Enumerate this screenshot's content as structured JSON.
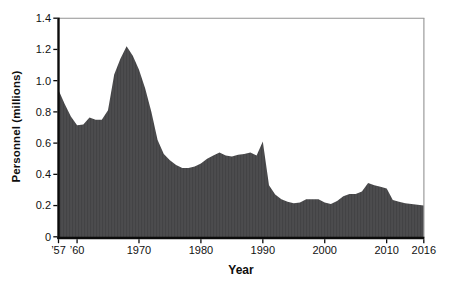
{
  "figure": {
    "background": "#ffffff"
  },
  "chart_data": {
    "type": "area",
    "title": "",
    "xlabel": "Year",
    "ylabel": "Personnel (millions)",
    "xlim": [
      1957,
      2016
    ],
    "ylim": [
      0,
      1.4
    ],
    "grid": false,
    "legend": "none",
    "x": [
      1957,
      1958,
      1959,
      1960,
      1961,
      1962,
      1963,
      1964,
      1965,
      1966,
      1967,
      1968,
      1969,
      1970,
      1971,
      1972,
      1973,
      1974,
      1975,
      1976,
      1977,
      1978,
      1979,
      1980,
      1981,
      1982,
      1983,
      1984,
      1985,
      1986,
      1987,
      1988,
      1989,
      1990,
      1991,
      1992,
      1993,
      1994,
      1995,
      1996,
      1997,
      1998,
      1999,
      2000,
      2001,
      2002,
      2003,
      2004,
      2005,
      2006,
      2007,
      2008,
      2009,
      2010,
      2011,
      2012,
      2013,
      2014,
      2015,
      2016
    ],
    "series": [
      {
        "name": "Personnel (millions)",
        "values": [
          0.94,
          0.85,
          0.77,
          0.715,
          0.72,
          0.765,
          0.75,
          0.75,
          0.81,
          1.04,
          1.14,
          1.22,
          1.16,
          1.07,
          0.95,
          0.8,
          0.62,
          0.53,
          0.49,
          0.46,
          0.44,
          0.44,
          0.45,
          0.47,
          0.5,
          0.52,
          0.54,
          0.52,
          0.515,
          0.525,
          0.53,
          0.54,
          0.52,
          0.61,
          0.33,
          0.27,
          0.24,
          0.225,
          0.215,
          0.22,
          0.24,
          0.24,
          0.24,
          0.22,
          0.21,
          0.23,
          0.26,
          0.275,
          0.275,
          0.29,
          0.345,
          0.33,
          0.32,
          0.31,
          0.235,
          0.225,
          0.215,
          0.21,
          0.205,
          0.2
        ]
      }
    ],
    "x_ticks": [
      {
        "year": 1957,
        "label": "’57"
      },
      {
        "year": 1960,
        "label": "’60"
      },
      {
        "year": 1970,
        "label": "1970"
      },
      {
        "year": 1980,
        "label": "1980"
      },
      {
        "year": 1990,
        "label": "1990"
      },
      {
        "year": 2000,
        "label": "2000"
      },
      {
        "year": 2010,
        "label": "2010"
      },
      {
        "year": 2016,
        "label": "2016"
      }
    ],
    "y_ticks": [
      {
        "value": 0,
        "label": "0"
      },
      {
        "value": 0.2,
        "label": "0.2"
      },
      {
        "value": 0.4,
        "label": "0.4"
      },
      {
        "value": 0.6,
        "label": "0.6"
      },
      {
        "value": 0.8,
        "label": "0.8"
      },
      {
        "value": 1.0,
        "label": "1.0"
      },
      {
        "value": 1.2,
        "label": "1.2"
      },
      {
        "value": 1.4,
        "label": "1.4"
      }
    ],
    "colors": {
      "area_fill": "#4c4c4e",
      "area_stripe": "#434345",
      "axis": "#0b0b0b",
      "frame": "#929292",
      "tick_label": "#111111"
    }
  }
}
